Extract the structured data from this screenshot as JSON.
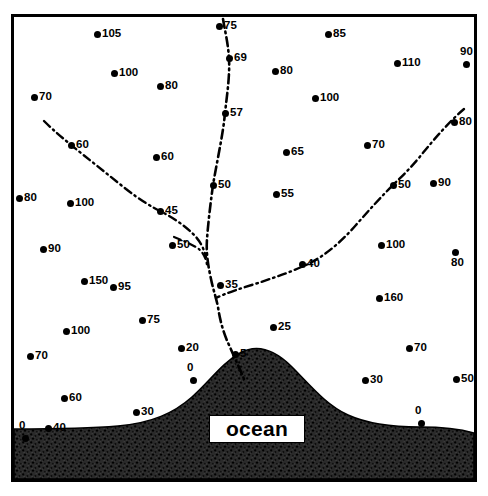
{
  "figure": {
    "title": "",
    "title_note": "clipped-by-top-edge",
    "ocean_label": "ocean",
    "frame_color": "#000000",
    "ocean_fill": "#2a2a2a",
    "land_fill": "#ffffff",
    "river_color": "#000000",
    "point_color": "#000000"
  },
  "chart_data": {
    "type": "scatter",
    "title": "",
    "xlabel": "",
    "ylabel": "",
    "grid": false,
    "legend": "none",
    "xlim": [
      0,
      460
    ],
    "ylim": [
      0,
      462
    ],
    "value_unit": "",
    "points": [
      {
        "label": "105",
        "value": 105,
        "x": 83,
        "y": 17,
        "label_pos": "right"
      },
      {
        "label": "75",
        "value": 75,
        "x": 205,
        "y": 9,
        "label_pos": "right"
      },
      {
        "label": "85",
        "value": 85,
        "x": 314,
        "y": 17,
        "label_pos": "right"
      },
      {
        "label": "69",
        "value": 69,
        "x": 215,
        "y": 41,
        "label_pos": "right"
      },
      {
        "label": "100",
        "value": 100,
        "x": 100,
        "y": 56,
        "label_pos": "right"
      },
      {
        "label": "80",
        "value": 80,
        "x": 261,
        "y": 54,
        "label_pos": "right"
      },
      {
        "label": "110",
        "value": 110,
        "x": 383,
        "y": 46,
        "label_pos": "right"
      },
      {
        "label": "90",
        "value": 90,
        "x": 452,
        "y": 47,
        "label_pos": "above"
      },
      {
        "label": "80",
        "value": 80,
        "x": 146,
        "y": 69,
        "label_pos": "right"
      },
      {
        "label": "100",
        "value": 100,
        "x": 301,
        "y": 81,
        "label_pos": "right"
      },
      {
        "label": "70",
        "value": 70,
        "x": 20,
        "y": 80,
        "label_pos": "right"
      },
      {
        "label": "57",
        "value": 57,
        "x": 211,
        "y": 96,
        "label_pos": "right"
      },
      {
        "label": "80",
        "value": 80,
        "x": 440,
        "y": 105,
        "label_pos": "right"
      },
      {
        "label": "60",
        "value": 60,
        "x": 57,
        "y": 128,
        "label_pos": "right"
      },
      {
        "label": "60",
        "value": 60,
        "x": 142,
        "y": 140,
        "label_pos": "right"
      },
      {
        "label": "65",
        "value": 65,
        "x": 272,
        "y": 135,
        "label_pos": "right"
      },
      {
        "label": "70",
        "value": 70,
        "x": 353,
        "y": 128,
        "label_pos": "right"
      },
      {
        "label": "50",
        "value": 50,
        "x": 199,
        "y": 168,
        "label_pos": "right"
      },
      {
        "label": "50",
        "value": 50,
        "x": 379,
        "y": 168,
        "label_pos": "right"
      },
      {
        "label": "90",
        "value": 90,
        "x": 419,
        "y": 166,
        "label_pos": "right"
      },
      {
        "label": "80",
        "value": 80,
        "x": 5,
        "y": 181,
        "label_pos": "right"
      },
      {
        "label": "100",
        "value": 100,
        "x": 56,
        "y": 186,
        "label_pos": "right"
      },
      {
        "label": "55",
        "value": 55,
        "x": 262,
        "y": 177,
        "label_pos": "right"
      },
      {
        "label": "45",
        "value": 45,
        "x": 146,
        "y": 194,
        "label_pos": "right"
      },
      {
        "label": "50",
        "value": 50,
        "x": 158,
        "y": 228,
        "label_pos": "right"
      },
      {
        "label": "90",
        "value": 90,
        "x": 29,
        "y": 232,
        "label_pos": "right"
      },
      {
        "label": "100",
        "value": 100,
        "x": 367,
        "y": 228,
        "label_pos": "right"
      },
      {
        "label": "80",
        "value": 80,
        "x": 441,
        "y": 235,
        "label_pos": "below"
      },
      {
        "label": "40",
        "value": 40,
        "x": 288,
        "y": 247,
        "label_pos": "right"
      },
      {
        "label": "150",
        "value": 150,
        "x": 70,
        "y": 264,
        "label_pos": "right"
      },
      {
        "label": "95",
        "value": 95,
        "x": 99,
        "y": 270,
        "label_pos": "right"
      },
      {
        "label": "35",
        "value": 35,
        "x": 206,
        "y": 268,
        "label_pos": "right"
      },
      {
        "label": "160",
        "value": 160,
        "x": 365,
        "y": 281,
        "label_pos": "right"
      },
      {
        "label": "75",
        "value": 75,
        "x": 128,
        "y": 303,
        "label_pos": "right"
      },
      {
        "label": "100",
        "value": 100,
        "x": 52,
        "y": 314,
        "label_pos": "right"
      },
      {
        "label": "25",
        "value": 25,
        "x": 259,
        "y": 310,
        "label_pos": "right"
      },
      {
        "label": "20",
        "value": 20,
        "x": 167,
        "y": 331,
        "label_pos": "right"
      },
      {
        "label": "5",
        "value": 5,
        "x": 221,
        "y": 337,
        "label_pos": "right"
      },
      {
        "label": "70",
        "value": 70,
        "x": 395,
        "y": 331,
        "label_pos": "right"
      },
      {
        "label": "70",
        "value": 70,
        "x": 16,
        "y": 339,
        "label_pos": "right"
      },
      {
        "label": "0",
        "value": 0,
        "x": 179,
        "y": 363,
        "label_pos": "above"
      },
      {
        "label": "30",
        "value": 30,
        "x": 351,
        "y": 363,
        "label_pos": "right"
      },
      {
        "label": "50",
        "value": 50,
        "x": 442,
        "y": 362,
        "label_pos": "right"
      },
      {
        "label": "60",
        "value": 60,
        "x": 50,
        "y": 381,
        "label_pos": "right"
      },
      {
        "label": "30",
        "value": 30,
        "x": 122,
        "y": 395,
        "label_pos": "right"
      },
      {
        "label": "0",
        "value": 0,
        "x": 407,
        "y": 406,
        "label_pos": "above"
      },
      {
        "label": "40",
        "value": 40,
        "x": 34,
        "y": 411,
        "label_pos": "right"
      },
      {
        "label": "0",
        "value": 0,
        "x": 11,
        "y": 421,
        "label_pos": "above"
      }
    ]
  }
}
